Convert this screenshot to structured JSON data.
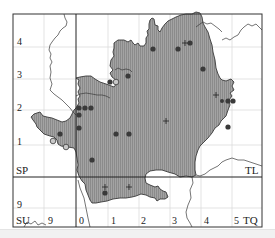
{
  "map": {
    "colors": {
      "region_fill": "#9a9a9a",
      "hatch": "#8a8a8a",
      "outline": "#333333",
      "frame": "#333333",
      "grid_major": "#333333",
      "grid_minor": "#dcdcdc",
      "record_dot": "#3a3a3a",
      "open_circle_fill": "#c8c8c8",
      "bottom_band": "#f1f1f1"
    },
    "grid_square_labels": {
      "sp": "SP",
      "tl": "TL",
      "su": "SU",
      "tq": "TQ"
    },
    "y_axis_labels": [
      "4",
      "3",
      "2",
      "1",
      "9"
    ],
    "x_axis_labels": [
      "9",
      "0",
      "1",
      "2",
      "3",
      "4",
      "5"
    ],
    "legend_symbols": {
      "filled_circle": "record-dot",
      "open_circle": "old-record",
      "plus": "cross-record"
    }
  }
}
